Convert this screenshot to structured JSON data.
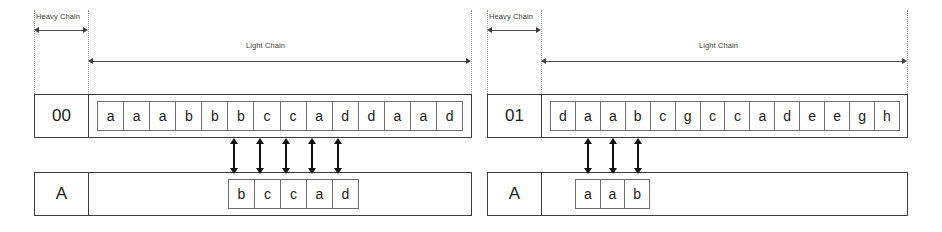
{
  "diagram": {
    "labels": {
      "heavy_chain": "Heavy Chain",
      "light_chain": "Light Chain"
    },
    "colors": {
      "line": "#3d3d3d",
      "cell_border": "#6e6e6e",
      "arrow": "#101010",
      "guide": "#9a9a9a",
      "background": "#ffffff"
    },
    "panels": [
      {
        "name": "left-panel",
        "heavy_chain_label": "Heavy Chain",
        "light_chain_label": "Light Chain",
        "top_row": {
          "id": "00",
          "letters": [
            "a",
            "a",
            "a",
            "b",
            "b",
            "b",
            "c",
            "c",
            "a",
            "d",
            "d",
            "a",
            "a",
            "d"
          ],
          "count": 14
        },
        "bottom_row": {
          "id": "A",
          "letters": [
            "b",
            "c",
            "c",
            "a",
            "d"
          ],
          "count": 5,
          "aligned_start_index": 6,
          "aligned_end_index": 10
        },
        "connector_count": 5
      },
      {
        "name": "right-panel",
        "heavy_chain_label": "Heavy Chain",
        "light_chain_label": "Light Chain",
        "top_row": {
          "id": "01",
          "letters": [
            "d",
            "a",
            "a",
            "b",
            "c",
            "g",
            "c",
            "c",
            "a",
            "d",
            "e",
            "e",
            "g",
            "h"
          ],
          "count": 14
        },
        "bottom_row": {
          "id": "A",
          "letters": [
            "a",
            "a",
            "b"
          ],
          "count": 3,
          "aligned_start_index": 2,
          "aligned_end_index": 4
        },
        "connector_count": 3
      }
    ]
  }
}
